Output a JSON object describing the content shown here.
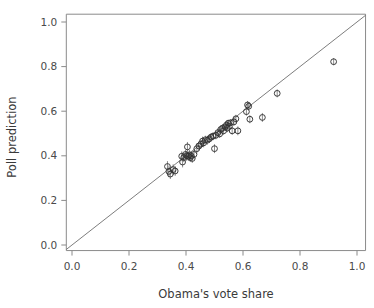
{
  "chart_data": {
    "type": "scatter",
    "title": "",
    "xlabel": "Obama's vote share",
    "ylabel": "Poll prediction",
    "xlim": [
      -0.02,
      1.03
    ],
    "ylim": [
      -0.025,
      1.035
    ],
    "xticks": [
      0.0,
      0.2,
      0.4,
      0.6,
      0.8,
      1.0
    ],
    "yticks": [
      0.0,
      0.2,
      0.4,
      0.6,
      0.8,
      1.0
    ],
    "xticklabels": [
      "0.0",
      "0.2",
      "0.4",
      "0.6",
      "0.8",
      "1.0"
    ],
    "yticklabels": [
      "0.0",
      "0.2",
      "0.4",
      "0.6",
      "0.8",
      "1.0"
    ],
    "grid": false,
    "legend": null,
    "marker_style": "open-circle",
    "error_bars": "vertical",
    "reference_line": {
      "name": "identity-line",
      "description": "y = x diagonal",
      "slope": 1.0,
      "intercept": 0.0,
      "x_start": -0.02,
      "x_end": 1.03
    },
    "n_points": 51,
    "x": [
      0.335,
      0.34,
      0.345,
      0.355,
      0.362,
      0.385,
      0.388,
      0.392,
      0.398,
      0.402,
      0.405,
      0.408,
      0.412,
      0.415,
      0.418,
      0.422,
      0.428,
      0.438,
      0.445,
      0.452,
      0.458,
      0.462,
      0.468,
      0.475,
      0.482,
      0.488,
      0.495,
      0.5,
      0.505,
      0.512,
      0.518,
      0.522,
      0.528,
      0.532,
      0.538,
      0.542,
      0.545,
      0.548,
      0.552,
      0.556,
      0.562,
      0.568,
      0.575,
      0.582,
      0.612,
      0.616,
      0.62,
      0.624,
      0.668,
      0.72,
      0.918
    ],
    "y": [
      0.352,
      0.33,
      0.318,
      0.338,
      0.332,
      0.398,
      0.372,
      0.392,
      0.406,
      0.4,
      0.44,
      0.398,
      0.404,
      0.392,
      0.4,
      0.388,
      0.406,
      0.432,
      0.444,
      0.452,
      0.466,
      0.458,
      0.472,
      0.47,
      0.476,
      0.484,
      0.488,
      0.432,
      0.492,
      0.504,
      0.498,
      0.518,
      0.524,
      0.512,
      0.53,
      0.538,
      0.524,
      0.546,
      0.532,
      0.548,
      0.512,
      0.552,
      0.566,
      0.512,
      0.598,
      0.628,
      0.622,
      0.564,
      0.572,
      0.68,
      0.822
    ],
    "yerr": [
      0.024,
      0.026,
      0.022,
      0.024,
      0.022,
      0.022,
      0.024,
      0.02,
      0.02,
      0.022,
      0.022,
      0.02,
      0.022,
      0.02,
      0.022,
      0.02,
      0.022,
      0.022,
      0.02,
      0.02,
      0.02,
      0.02,
      0.018,
      0.02,
      0.018,
      0.018,
      0.018,
      0.02,
      0.018,
      0.018,
      0.018,
      0.018,
      0.018,
      0.018,
      0.016,
      0.018,
      0.018,
      0.016,
      0.018,
      0.016,
      0.018,
      0.018,
      0.018,
      0.02,
      0.018,
      0.018,
      0.018,
      0.018,
      0.02,
      0.018,
      0.016
    ]
  },
  "colors": {
    "background": "#ffffff",
    "axis": "#8a8a8a",
    "marker_stroke": "#333333",
    "errorbar": "#7d7d7d",
    "reference_line": "#6e6e6e",
    "text": "#3a3a3a"
  }
}
